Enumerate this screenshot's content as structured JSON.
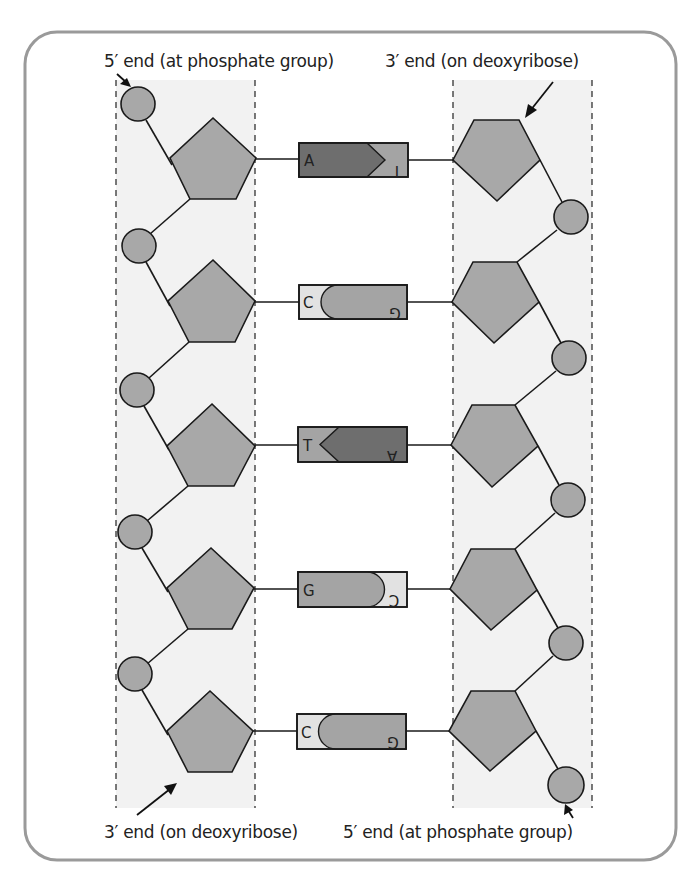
{
  "labels": {
    "top_left": "5′ end (at phosphate group)",
    "top_right": "3′ end (on deoxyribose)",
    "bottom_left": "3′ end (on deoxyribose)",
    "bottom_right": "5′ end (at phosphate group)"
  },
  "colors": {
    "frame": "#9a9a9a",
    "backbone_panel": "#f2f2f2",
    "sugar": "#a8a8a8",
    "phosphate": "#a8a8a8",
    "outline": "#1a1a1a",
    "dark_base": "#6e6e6e",
    "medium_base": "#a4a4a4",
    "light_base": "#e2e2e2"
  },
  "strands": {
    "left": {
      "direction": "5′ to 3′ (top to bottom)",
      "components": [
        "phosphate",
        "deoxyribose"
      ]
    },
    "right": {
      "direction": "3′ to 5′ (top to bottom)",
      "components": [
        "deoxyribose",
        "phosphate"
      ]
    }
  },
  "base_pairs": [
    {
      "left": "A",
      "right": "T",
      "left_text": "A",
      "right_text": "T",
      "left_rotated": false,
      "right_rotated": true,
      "type": "arrow",
      "left_shade": "dark",
      "right_shade": "medium"
    },
    {
      "left": "C",
      "right": "G",
      "left_text": "C",
      "right_text": "G",
      "left_rotated": false,
      "right_rotated": true,
      "type": "round",
      "left_shade": "light",
      "right_shade": "medium"
    },
    {
      "left": "T",
      "right": "A",
      "left_text": "T",
      "right_text": "A",
      "left_rotated": false,
      "right_rotated": true,
      "type": "arrow",
      "left_shade": "medium",
      "right_shade": "dark"
    },
    {
      "left": "G",
      "right": "C",
      "left_text": "G",
      "right_text": "C",
      "left_rotated": false,
      "right_rotated": true,
      "type": "round",
      "left_shade": "medium",
      "right_shade": "light"
    },
    {
      "left": "C",
      "right": "G",
      "left_text": "C",
      "right_text": "G",
      "left_rotated": false,
      "right_rotated": true,
      "type": "round",
      "left_shade": "light",
      "right_shade": "medium"
    }
  ]
}
